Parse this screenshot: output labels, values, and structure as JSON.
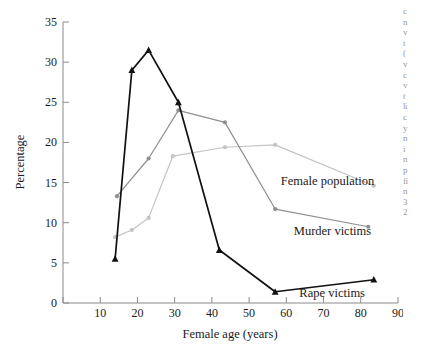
{
  "figure": {
    "background_color": "#ffffff",
    "margin_text_lines": [
      "c",
      "n",
      "v",
      "t",
      "(",
      "v",
      "c",
      "v",
      "t",
      "li",
      "c",
      "y",
      "n",
      "i",
      "n",
      "p",
      "fi",
      "n",
      "3",
      "2"
    ]
  },
  "chart_data": {
    "type": "line",
    "title": "",
    "xlabel": "Female age (years)",
    "ylabel": "Percentage",
    "xlim": [
      0,
      90
    ],
    "ylim": [
      0,
      35
    ],
    "xticks": [
      0,
      10,
      20,
      30,
      40,
      50,
      60,
      70,
      80,
      90
    ],
    "xticklabels": [
      "",
      "10",
      "20",
      "30",
      "40",
      "50",
      "60",
      "70",
      "80",
      "90"
    ],
    "yticks": [
      0,
      5,
      10,
      15,
      20,
      25,
      30,
      35
    ],
    "yticklabels": [
      "0",
      "5",
      "10",
      "15",
      "20",
      "25",
      "30",
      "35"
    ],
    "grid": false,
    "legend_position": "inline-annotations",
    "series": [
      {
        "name": "Female population",
        "color": "#c4c4c4",
        "marker": "circle",
        "x": [
          14,
          18.5,
          23,
          29.5,
          43.5,
          57,
          83.5
        ],
        "y": [
          8.2,
          9.1,
          10.6,
          18.3,
          19.4,
          19.7,
          14.6
        ],
        "annotation": {
          "label": "Female population",
          "x": 58.5,
          "y": 15.2
        }
      },
      {
        "name": "Murder victims",
        "color": "#8f8f8f",
        "marker": "circle",
        "x": [
          14.5,
          23,
          31,
          43.5,
          57,
          82
        ],
        "y": [
          13.3,
          18.0,
          24.0,
          22.5,
          11.7,
          9.5
        ],
        "annotation": {
          "label": "Murder victims",
          "x": 62.0,
          "y": 9.0
        }
      },
      {
        "name": "Rape victims",
        "color": "#111111",
        "marker": "triangle",
        "x": [
          14,
          18.5,
          23,
          31,
          42,
          57,
          83.5
        ],
        "y": [
          5.5,
          29.0,
          31.5,
          25.0,
          6.6,
          1.4,
          2.9
        ],
        "annotation": {
          "label": "Rape victims",
          "x": 63.5,
          "y": 1.2
        }
      }
    ]
  }
}
